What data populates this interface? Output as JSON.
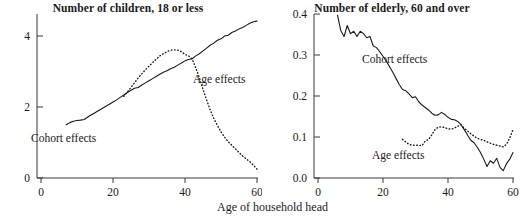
{
  "figure": {
    "xlabel": "Age of household head",
    "panels": [
      {
        "key": "children",
        "title": "Number of children, 18 or less",
        "annotations": {
          "cohort": "Cohort effects",
          "age": "Age effects"
        },
        "yticks": [
          "0",
          "2",
          "4"
        ],
        "xticks": [
          "0",
          "20",
          "40",
          "60"
        ]
      },
      {
        "key": "elderly",
        "title": "Number of elderly,  60 and over",
        "annotations": {
          "cohort": "Cohort effects",
          "age": "Age effects"
        },
        "yticks": [
          "0.0",
          "0.1",
          "0.2",
          "0.3",
          "0.4"
        ],
        "xticks": [
          "0",
          "20",
          "40",
          "60"
        ]
      }
    ]
  },
  "chart_data": [
    {
      "type": "line",
      "title": "Number of children, 18 or less",
      "xlabel": "Age of household head",
      "ylabel": "",
      "xlim": [
        0,
        62
      ],
      "ylim": [
        0,
        4.6
      ],
      "xticks": [
        0,
        20,
        40,
        60
      ],
      "yticks": [
        0,
        2,
        4
      ],
      "grid": false,
      "legend": "inline-annotations",
      "series": [
        {
          "name": "Cohort effects",
          "style": "solid",
          "x": [
            7,
            8,
            9,
            10,
            11,
            12,
            13,
            14,
            15,
            16,
            17,
            18,
            19,
            20,
            21,
            22,
            23,
            24,
            25,
            26,
            27,
            28,
            29,
            30,
            31,
            32,
            33,
            34,
            35,
            36,
            37,
            38,
            39,
            40,
            41,
            42,
            43,
            44,
            45,
            46,
            47,
            48,
            49,
            50,
            51,
            52,
            53,
            54,
            55,
            56,
            57,
            58,
            59,
            60
          ],
          "values": [
            1.5,
            1.56,
            1.6,
            1.62,
            1.63,
            1.65,
            1.72,
            1.78,
            1.84,
            1.9,
            1.96,
            2.02,
            2.08,
            2.14,
            2.2,
            2.27,
            2.34,
            2.41,
            2.47,
            2.53,
            2.55,
            2.62,
            2.68,
            2.74,
            2.8,
            2.86,
            2.92,
            2.98,
            3.02,
            3.08,
            3.12,
            3.18,
            3.24,
            3.3,
            3.34,
            3.36,
            3.44,
            3.5,
            3.58,
            3.66,
            3.74,
            3.8,
            3.88,
            3.92,
            4.0,
            4.02,
            4.1,
            4.14,
            4.2,
            4.24,
            4.3,
            4.36,
            4.4,
            4.42
          ]
        },
        {
          "name": "Age effects",
          "style": "dotted",
          "x": [
            23,
            25,
            27,
            29,
            31,
            33,
            35,
            36,
            37,
            38,
            39,
            40,
            41,
            42,
            43,
            44,
            45,
            46,
            47,
            48,
            49,
            50,
            51,
            52,
            53,
            54,
            55,
            56,
            57,
            58,
            59,
            60
          ],
          "values": [
            2.3,
            2.55,
            2.82,
            3.05,
            3.25,
            3.44,
            3.56,
            3.6,
            3.61,
            3.6,
            3.56,
            3.48,
            3.44,
            3.35,
            3.1,
            2.82,
            2.5,
            2.2,
            1.92,
            1.68,
            1.48,
            1.3,
            1.15,
            1.02,
            0.92,
            0.82,
            0.72,
            0.62,
            0.54,
            0.46,
            0.36,
            0.25
          ]
        }
      ]
    },
    {
      "type": "line",
      "title": "Number of elderly,  60 and over",
      "xlabel": "Age of household head",
      "ylabel": "",
      "xlim": [
        0,
        62
      ],
      "ylim": [
        0.0,
        0.42
      ],
      "xticks": [
        0,
        20,
        40,
        60
      ],
      "yticks": [
        0.0,
        0.1,
        0.2,
        0.3,
        0.4
      ],
      "grid": false,
      "legend": "inline-annotations",
      "series": [
        {
          "name": "Cohort effects",
          "style": "solid",
          "x": [
            6,
            7,
            8,
            9,
            10,
            11,
            12,
            13,
            14,
            15,
            16,
            17,
            18,
            19,
            20,
            21,
            22,
            23,
            24,
            25,
            26,
            27,
            28,
            29,
            30,
            31,
            32,
            33,
            34,
            35,
            36,
            37,
            38,
            39,
            40,
            41,
            42,
            43,
            44,
            45,
            46,
            47,
            48,
            49,
            50,
            51,
            52,
            53,
            54,
            55,
            56,
            57,
            58,
            59,
            60
          ],
          "values": [
            0.397,
            0.36,
            0.345,
            0.372,
            0.352,
            0.358,
            0.345,
            0.358,
            0.352,
            0.342,
            0.345,
            0.322,
            0.318,
            0.308,
            0.297,
            0.285,
            0.272,
            0.258,
            0.243,
            0.228,
            0.216,
            0.213,
            0.205,
            0.196,
            0.198,
            0.186,
            0.178,
            0.172,
            0.166,
            0.158,
            0.153,
            0.154,
            0.16,
            0.155,
            0.148,
            0.143,
            0.142,
            0.138,
            0.13,
            0.118,
            0.105,
            0.092,
            0.086,
            0.075,
            0.062,
            0.046,
            0.028,
            0.042,
            0.036,
            0.048,
            0.026,
            0.018,
            0.035,
            0.046,
            0.062
          ]
        },
        {
          "name": "Age effects",
          "style": "dotted",
          "x": [
            26,
            27,
            28,
            29,
            30,
            31,
            32,
            33,
            34,
            35,
            36,
            37,
            38,
            39,
            40,
            41,
            42,
            43,
            44,
            45,
            46,
            47,
            48,
            49,
            50,
            51,
            52,
            53,
            54,
            55,
            56,
            57,
            58,
            59,
            60
          ],
          "values": [
            0.094,
            0.088,
            0.082,
            0.08,
            0.08,
            0.08,
            0.079,
            0.09,
            0.094,
            0.105,
            0.118,
            0.124,
            0.125,
            0.123,
            0.12,
            0.119,
            0.122,
            0.126,
            0.13,
            0.121,
            0.115,
            0.108,
            0.102,
            0.097,
            0.094,
            0.092,
            0.088,
            0.085,
            0.082,
            0.08,
            0.078,
            0.076,
            0.082,
            0.098,
            0.118
          ]
        }
      ]
    }
  ]
}
